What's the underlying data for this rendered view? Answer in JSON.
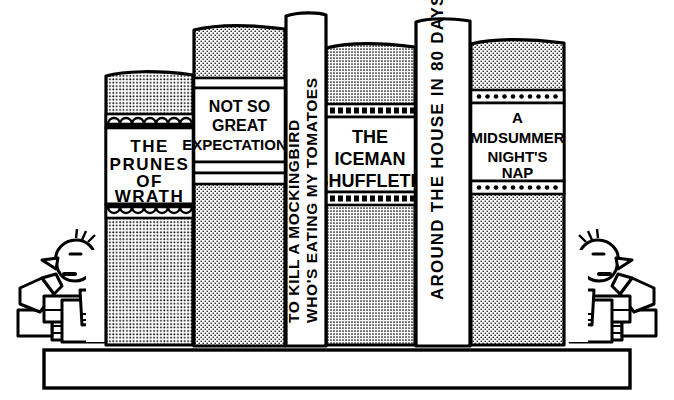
{
  "scene": {
    "title": "Bookshelf cartoon with six humorous parody book spines",
    "style": "black-and-white pen-and-ink cartoon",
    "background_color": "#ffffff",
    "ink_color": "#000000"
  },
  "shelf": {
    "name": "bookshelf-plank",
    "fill": "#ffffff",
    "stroke": "#000000"
  },
  "bookends": {
    "left": {
      "label": "left-bookend-figure",
      "description": "cartoon person leaning on shelf with stack of small books"
    },
    "right": {
      "label": "right-bookend-figure",
      "description": "mirrored cartoon person leaning on shelf with stack of small books"
    }
  },
  "books": [
    {
      "id": "book-prunes-of-wrath",
      "title_lines": [
        "THE",
        "PRUNES",
        "OF",
        "WRATH"
      ],
      "orientation": "horizontal",
      "cover_fill": "#b8b8b8",
      "label_fill": "#ffffff",
      "band_style": "scalloped-arches"
    },
    {
      "id": "book-not-so-great-expectations",
      "title_lines": [
        "NOT SO",
        "GREAT",
        "EXPECTATIONS"
      ],
      "orientation": "horizontal",
      "cover_fill": "#dcdcdc",
      "label_fill": "#ffffff",
      "band_style": "plain-rules"
    },
    {
      "id": "book-to-kill-a-mockingbird",
      "title_lines": [
        "TO KILL A MOCKINGBIRD",
        "WHO'S EATING MY TOMATOES"
      ],
      "orientation": "vertical",
      "cover_fill": "#ffffff",
      "label_fill": "#ffffff",
      "band_style": "none"
    },
    {
      "id": "book-the-iceman-shuffleth",
      "title_lines": [
        "THE",
        "ICEMAN",
        "SHUFFLETH"
      ],
      "orientation": "horizontal",
      "cover_fill": "#d2d2d2",
      "label_fill": "#ffffff",
      "band_style": "dashed-blocks"
    },
    {
      "id": "book-around-the-house-in-80-days",
      "title_lines": [
        "AROUND THE HOUSE IN 80 DAYS"
      ],
      "orientation": "vertical",
      "cover_fill": "#ffffff",
      "label_fill": "#ffffff",
      "band_style": "none"
    },
    {
      "id": "book-a-midsummer-nights-nap",
      "title_lines": [
        "A",
        "MIDSUMMER",
        "NIGHT'S",
        "NAP"
      ],
      "orientation": "horizontal",
      "cover_fill": "#b8b8b8",
      "label_fill": "#ffffff",
      "band_style": "round-dots"
    }
  ]
}
